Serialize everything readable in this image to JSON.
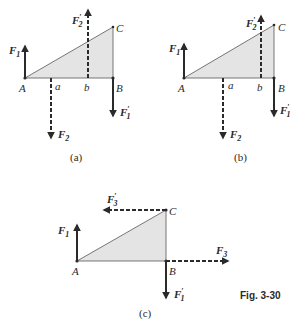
{
  "figure": {
    "label": "Fig. 3-30",
    "triangle_fill": "#e4e4e4",
    "line_color": "#2a2a2a"
  },
  "panels": [
    {
      "caption": "(a)",
      "points": {
        "A": "A",
        "a": "a",
        "b": "b",
        "B": "B",
        "C": "C"
      },
      "forces": {
        "F1": {
          "base": "F",
          "sub": "1",
          "prime": ""
        },
        "F2": {
          "base": "F",
          "sub": "2",
          "prime": ""
        },
        "F2p": {
          "base": "F",
          "sub": "2",
          "prime": "′"
        },
        "F1p": {
          "base": "F",
          "sub": "1",
          "prime": "′"
        }
      }
    },
    {
      "caption": "(b)",
      "points": {
        "A": "A",
        "a": "a",
        "b": "b",
        "B": "B",
        "C": "C"
      },
      "forces": {
        "F1": {
          "base": "F",
          "sub": "1",
          "prime": ""
        },
        "F2": {
          "base": "F",
          "sub": "2",
          "prime": ""
        },
        "F2p": {
          "base": "F",
          "sub": "2",
          "prime": "′"
        },
        "F1p": {
          "base": "F",
          "sub": "1",
          "prime": "′"
        }
      }
    },
    {
      "caption": "(c)",
      "points": {
        "A": "A",
        "B": "B",
        "C": "C"
      },
      "forces": {
        "F1": {
          "base": "F",
          "sub": "1",
          "prime": ""
        },
        "F3": {
          "base": "F",
          "sub": "3",
          "prime": ""
        },
        "F3p": {
          "base": "F",
          "sub": "3",
          "prime": "′"
        },
        "F1p": {
          "base": "F",
          "sub": "1",
          "prime": "′"
        }
      }
    }
  ]
}
